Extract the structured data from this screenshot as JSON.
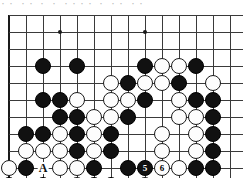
{
  "caption": "・・ ・・   ・ ・ ・・・・ ・ ・・  ・・",
  "board": {
    "type": "go-board-diagram",
    "cols": 15,
    "rows": 10,
    "cell": 17,
    "origin_x": 9,
    "origin_y": 6,
    "edges": {
      "left": true,
      "bottom": true,
      "top": false,
      "right": false
    },
    "star_points": [
      {
        "col": 3,
        "row": 1
      },
      {
        "col": 8,
        "row": 1
      }
    ],
    "colors": {
      "black": "#111111",
      "white": "#fdfdfd",
      "line": "#3a3a3a",
      "edge": "#1a1a1a"
    },
    "stones": [
      {
        "col": 2,
        "row": 3,
        "color": "black"
      },
      {
        "col": 4,
        "row": 3,
        "color": "black"
      },
      {
        "col": 8,
        "row": 3,
        "color": "black"
      },
      {
        "col": 9,
        "row": 3,
        "color": "white"
      },
      {
        "col": 10,
        "row": 3,
        "color": "white"
      },
      {
        "col": 11,
        "row": 3,
        "color": "black"
      },
      {
        "col": 6,
        "row": 4,
        "color": "white"
      },
      {
        "col": 7,
        "row": 4,
        "color": "black"
      },
      {
        "col": 8,
        "row": 4,
        "color": "white"
      },
      {
        "col": 9,
        "row": 4,
        "color": "white"
      },
      {
        "col": 10,
        "row": 4,
        "color": "black"
      },
      {
        "col": 12,
        "row": 4,
        "color": "white"
      },
      {
        "col": 2,
        "row": 5,
        "color": "black"
      },
      {
        "col": 3,
        "row": 5,
        "color": "black"
      },
      {
        "col": 4,
        "row": 5,
        "color": "white"
      },
      {
        "col": 6,
        "row": 5,
        "color": "white"
      },
      {
        "col": 7,
        "row": 5,
        "color": "white"
      },
      {
        "col": 8,
        "row": 5,
        "color": "black"
      },
      {
        "col": 10,
        "row": 5,
        "color": "white"
      },
      {
        "col": 11,
        "row": 5,
        "color": "black"
      },
      {
        "col": 12,
        "row": 5,
        "color": "black"
      },
      {
        "col": 3,
        "row": 6,
        "color": "black"
      },
      {
        "col": 4,
        "row": 6,
        "color": "black"
      },
      {
        "col": 5,
        "row": 6,
        "color": "white"
      },
      {
        "col": 6,
        "row": 6,
        "color": "white"
      },
      {
        "col": 7,
        "row": 6,
        "color": "black"
      },
      {
        "col": 10,
        "row": 6,
        "color": "white"
      },
      {
        "col": 11,
        "row": 6,
        "color": "white"
      },
      {
        "col": 12,
        "row": 6,
        "color": "black"
      },
      {
        "col": 1,
        "row": 7,
        "color": "black"
      },
      {
        "col": 2,
        "row": 7,
        "color": "black"
      },
      {
        "col": 3,
        "row": 7,
        "color": "white"
      },
      {
        "col": 4,
        "row": 7,
        "color": "black"
      },
      {
        "col": 5,
        "row": 7,
        "color": "white"
      },
      {
        "col": 6,
        "row": 7,
        "color": "black"
      },
      {
        "col": 9,
        "row": 7,
        "color": "white"
      },
      {
        "col": 11,
        "row": 7,
        "color": "white"
      },
      {
        "col": 12,
        "row": 7,
        "color": "black"
      },
      {
        "col": 1,
        "row": 8,
        "color": "white"
      },
      {
        "col": 2,
        "row": 8,
        "color": "white"
      },
      {
        "col": 3,
        "row": 8,
        "color": "white"
      },
      {
        "col": 4,
        "row": 8,
        "color": "black"
      },
      {
        "col": 5,
        "row": 8,
        "color": "white"
      },
      {
        "col": 6,
        "row": 8,
        "color": "black"
      },
      {
        "col": 9,
        "row": 8,
        "color": "white"
      },
      {
        "col": 11,
        "row": 8,
        "color": "white"
      },
      {
        "col": 12,
        "row": 8,
        "color": "black"
      },
      {
        "col": 0,
        "row": 9,
        "color": "white"
      },
      {
        "col": 1,
        "row": 9,
        "color": "black"
      },
      {
        "col": 3,
        "row": 9,
        "color": "white"
      },
      {
        "col": 4,
        "row": 9,
        "color": "white"
      },
      {
        "col": 5,
        "row": 9,
        "color": "black"
      },
      {
        "col": 7,
        "row": 9,
        "color": "black"
      },
      {
        "col": 10,
        "row": 9,
        "color": "white"
      },
      {
        "col": 11,
        "row": 9,
        "color": "black"
      },
      {
        "col": 12,
        "row": 9,
        "color": "black"
      },
      {
        "col": 0,
        "row": 10,
        "color": "black",
        "number": "7"
      },
      {
        "col": 2,
        "row": 10,
        "color": "black"
      },
      {
        "col": 4,
        "row": 10,
        "color": "white",
        "number": "2"
      },
      {
        "col": 5,
        "row": 10,
        "color": "black"
      },
      {
        "col": 6,
        "row": 10,
        "color": "black",
        "number": "3"
      },
      {
        "col": 8,
        "row": 10,
        "color": "white",
        "number": "4"
      },
      {
        "col": 8,
        "row": 9,
        "color": "black",
        "number": "5"
      },
      {
        "col": 9,
        "row": 9,
        "color": "white",
        "number": "6"
      }
    ],
    "labels": [
      {
        "text": "A",
        "col": 2,
        "row": 9
      },
      {
        "text": "B",
        "col": 1,
        "row": 10
      },
      {
        "text": "C",
        "col": 9,
        "row": 10
      }
    ]
  }
}
